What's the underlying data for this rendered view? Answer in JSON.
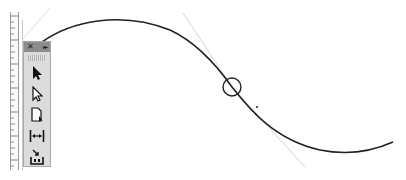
{
  "app": "Adobe InDesign",
  "panel": {
    "title": "Tools",
    "close_glyph": "✕",
    "collapse_glyph": "▸▸",
    "tools": [
      {
        "name": "selection-tool",
        "icon": "solid-arrow-icon"
      },
      {
        "name": "direct-selection-tool",
        "icon": "hollow-arrow-icon"
      },
      {
        "name": "page-tool",
        "icon": "page-icon"
      },
      {
        "name": "gap-tool",
        "icon": "gap-icon"
      },
      {
        "name": "content-collector-tool",
        "icon": "content-collector-icon"
      }
    ]
  },
  "canvas": {
    "path": {
      "start": [
        42,
        42
      ],
      "end": [
        393,
        142
      ],
      "anchor": [
        232,
        87
      ],
      "stroke": "#222222"
    },
    "handles": {
      "upper": [
        [
          183,
          13
        ],
        [
          232,
          87
        ]
      ],
      "lower": [
        [
          232,
          87
        ],
        [
          305,
          167
        ]
      ],
      "left": [
        [
          22,
          40
        ],
        [
          50,
          8
        ]
      ],
      "color": "#d6d6d6"
    },
    "anchor_circle": {
      "cx": 232,
      "cy": 87,
      "r": 9
    },
    "cursor_mark": [
      257,
      107
    ]
  },
  "colors": {
    "panel_bg": "#dcdcdc",
    "panel_header": "#8c8c8c",
    "ruler_border": "#9a9a9a"
  }
}
